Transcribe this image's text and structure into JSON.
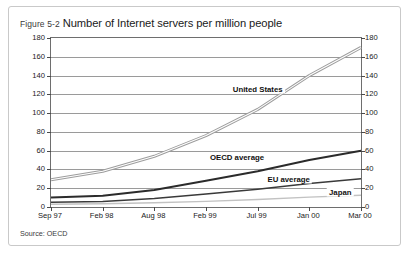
{
  "figure": {
    "number": "Figure 5-2",
    "title": "Number of Internet servers per million people",
    "source": "Source: OECD"
  },
  "chart_data": {
    "type": "line",
    "title": "Number of Internet servers per million people",
    "xlabel": "",
    "ylabel": "",
    "ylim": [
      0,
      180
    ],
    "yticks": [
      0,
      20,
      40,
      60,
      80,
      100,
      120,
      140,
      160,
      180
    ],
    "ytick_labels_left": [
      "0",
      "20",
      "40",
      "60",
      "80",
      "100",
      "120",
      "140",
      "160",
      "180"
    ],
    "ytick_labels_right": [
      "0",
      "20",
      "40",
      "60",
      "80",
      "100",
      "120",
      "140",
      "160",
      "180"
    ],
    "dual_axis": true,
    "grid": true,
    "legend": "inline-labels",
    "categories": [
      "Sep 97",
      "Feb 98",
      "Aug 98",
      "Feb 99",
      "Jul 99",
      "Jan 00",
      "Mar 00"
    ],
    "series": [
      {
        "name": "United States",
        "style": "light-gray-outline",
        "color": "#b9b9b9",
        "values": [
          29,
          38,
          54,
          76,
          104,
          140,
          170
        ],
        "label_x_index": 4,
        "label_value": 126
      },
      {
        "name": "OECD average",
        "style": "dark-bold",
        "color": "#2b2b2b",
        "values": [
          10,
          12,
          18,
          28,
          38,
          50,
          60
        ],
        "label_x_index": 3.6,
        "label_value": 53
      },
      {
        "name": "EU average",
        "style": "dark-medium",
        "color": "#3a3a3a",
        "values": [
          5,
          6,
          9,
          14,
          19,
          25,
          30
        ],
        "label_x_index": 4.6,
        "label_value": 30
      },
      {
        "name": "Japan",
        "style": "light-gray-thin",
        "color": "#c2c2c2",
        "values": [
          3,
          3.5,
          4.5,
          6,
          8,
          10.5,
          12.5
        ],
        "label_x_index": 5.6,
        "label_value": 16
      }
    ]
  }
}
